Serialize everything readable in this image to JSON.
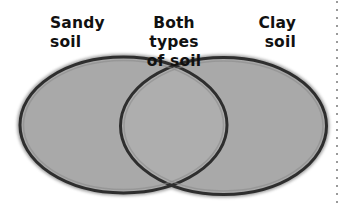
{
  "diagram": {
    "type": "venn",
    "sets": [
      {
        "id": "left",
        "label_lines": [
          "Sandy",
          "soil"
        ]
      },
      {
        "id": "intersection",
        "label_lines": [
          "Both types",
          "of soil"
        ]
      },
      {
        "id": "right",
        "label_lines": [
          "Clay",
          "soil"
        ]
      }
    ]
  },
  "labels": {
    "left": {
      "line1": "Sandy",
      "line2": "soil"
    },
    "middle": {
      "line1": "Both types",
      "line2": "of soil"
    },
    "right": {
      "line1": "Clay",
      "line2": "soil"
    }
  },
  "colors": {
    "fill": "#a9a9a9",
    "overlap_fill": "#aeaeae",
    "stroke": "#2e2e2e",
    "text": "#111111",
    "dots": "#9a9a9a",
    "background": "#ffffff"
  }
}
